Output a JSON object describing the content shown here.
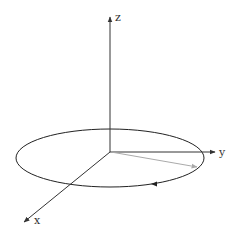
{
  "diagram": {
    "type": "3d-coordinate-axes",
    "axes": {
      "z": {
        "label": "z"
      },
      "y": {
        "label": "y"
      },
      "x": {
        "label": "x"
      }
    },
    "colors": {
      "axis": "#333333",
      "ellipse": "#222222",
      "vector": "#999999",
      "background": "#ffffff"
    }
  }
}
